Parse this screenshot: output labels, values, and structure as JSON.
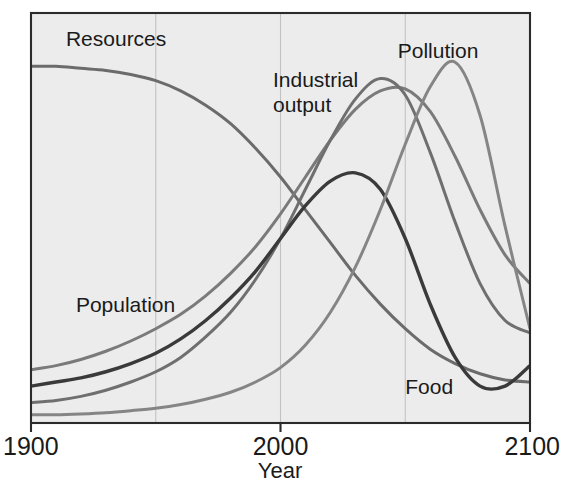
{
  "chart_data": {
    "type": "line",
    "title": "",
    "subtitle": "",
    "xlabel": "Year",
    "ylabel": "",
    "xlim": [
      1900,
      2100
    ],
    "ylim": [
      0,
      100
    ],
    "grid": true,
    "gridlines_x": [
      1950,
      2000,
      2050
    ],
    "legend_position": "inline-labels",
    "x_ticks": [
      {
        "value": 1900,
        "label": "1900"
      },
      {
        "value": 2000,
        "label": "2000"
      },
      {
        "value": 2100,
        "label": "2100"
      }
    ],
    "y_ticks": [],
    "x": [
      1900,
      1910,
      1920,
      1930,
      1940,
      1950,
      1960,
      1970,
      1980,
      1990,
      2000,
      2010,
      2020,
      2030,
      2040,
      2050,
      2060,
      2070,
      2080,
      2090,
      2100
    ],
    "series": [
      {
        "name": "Resources",
        "label": "Resources",
        "color": "#6b6b6b",
        "width": 3.0,
        "label_x": 1914,
        "label_y": 92,
        "values": [
          87,
          87,
          86.5,
          86,
          85,
          83.5,
          81,
          77.5,
          73,
          67,
          60,
          52,
          44,
          36,
          29,
          23,
          18,
          14.5,
          12,
          10.5,
          10
        ]
      },
      {
        "name": "Population",
        "label": "Population",
        "color": "#7a7a7a",
        "width": 3.0,
        "label_x": 1918,
        "label_y": 27,
        "values": [
          13,
          14,
          15.5,
          17.5,
          20,
          23,
          26.5,
          31,
          36.5,
          43,
          51,
          60,
          69,
          76.5,
          81,
          81.5,
          76,
          65,
          52,
          41,
          34
        ]
      },
      {
        "name": "Industrial output",
        "label": "Industrial\noutput",
        "color": "#6f6f6f",
        "width": 3.0,
        "label_x": 1997,
        "label_y": 82,
        "values": [
          5,
          5.5,
          6.5,
          8,
          10,
          12.5,
          16,
          21,
          27,
          35,
          45,
          57,
          69,
          79,
          84,
          80,
          66,
          49,
          34,
          25,
          22
        ]
      },
      {
        "name": "Food",
        "label": "Food",
        "color": "#3a3a3a",
        "width": 3.4,
        "label_x": 2050,
        "label_y": 7,
        "values": [
          9,
          10,
          11,
          12.5,
          14.5,
          17,
          20.5,
          25,
          30.5,
          37,
          45,
          53,
          59,
          61,
          57,
          45,
          29,
          16,
          9,
          9,
          14
        ]
      },
      {
        "name": "Pollution",
        "label": "Pollution",
        "color": "#858585",
        "width": 3.0,
        "label_x": 2047,
        "label_y": 89,
        "values": [
          2,
          2,
          2.2,
          2.5,
          3,
          3.6,
          4.5,
          5.8,
          7.5,
          10,
          13.5,
          19,
          27,
          38,
          52,
          68,
          82,
          88,
          75,
          48,
          23
        ]
      }
    ],
    "annotations": []
  },
  "colors": {
    "plot_background": "#ececec",
    "page_background": "#ffffff",
    "frame": "#2b2b2b",
    "gridline": "#c2c2c2",
    "text": "#1a1a1a"
  },
  "geometry": {
    "plot_left": 31,
    "plot_right": 530,
    "plot_top": 13,
    "plot_bottom": 423
  }
}
